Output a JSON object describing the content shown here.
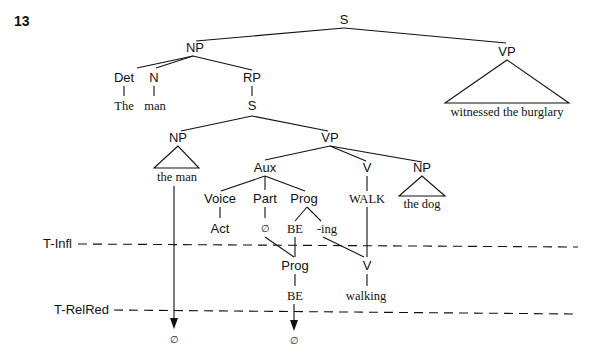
{
  "example_number": "13",
  "nodes": {
    "root_s": "S",
    "subj_np": "NP",
    "det": "Det",
    "det_word": "The",
    "n": "N",
    "n_word": "man",
    "rp": "RP",
    "rel_s": "S",
    "rel_np": "NP",
    "rel_np_words": "the man",
    "rel_vp": "VP",
    "aux": "Aux",
    "voice": "Voice",
    "voice_value": "Act",
    "part": "Part",
    "part_value": "∅",
    "prog": "Prog",
    "prog_be": "BE",
    "prog_ing": "-ing",
    "v": "V",
    "v_lexeme": "WALK",
    "obj_np": "NP",
    "obj_np_words": "the dog",
    "main_vp": "VP",
    "main_vp_words": "witnessed the burglary",
    "derived_prog": "Prog",
    "derived_be": "BE",
    "derived_v": "V",
    "derived_v_word": "walking",
    "deleted_np_result": "∅",
    "deleted_be_result": "∅"
  },
  "transformations": [
    {
      "label": "T-Infl"
    },
    {
      "label": "T-RelRed"
    }
  ]
}
